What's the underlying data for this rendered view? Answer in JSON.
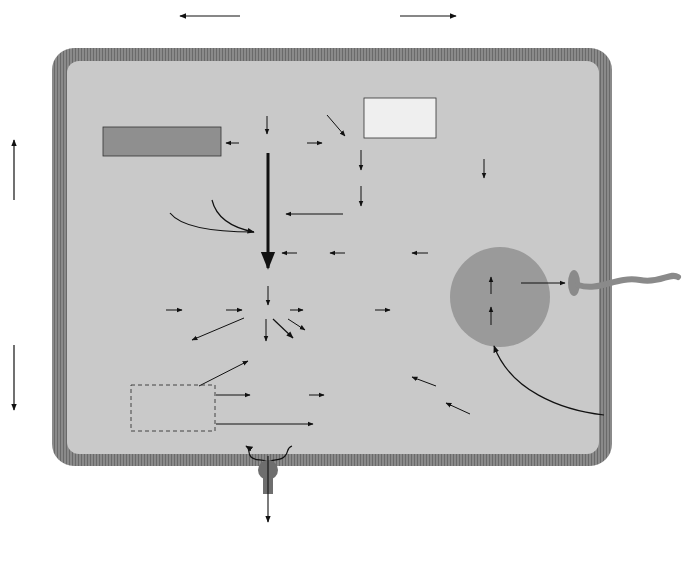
{
  "colors": {
    "cytoplasm": "#c9c9c9",
    "membrane": "#8a8a8a",
    "membrane_dark": "#6e6e6e",
    "abc_transporter": "#8e8e8e",
    "light_transporter": "#d6d6d6",
    "pathway_box_dark": "#8f8f8f",
    "pathway_box_light": "#efefef",
    "chemotaxis_circle": "#9a9a9a",
    "arrow": "#111111"
  },
  "headers": {
    "peptide_abc": "Peptide ABC transport systems",
    "sugar_abc": "Sugar ABC transport systems"
  },
  "pathways": {
    "pentose_phosphate": [
      "PENTOSE PHOSPHATE",
      "PATHWAY"
    ],
    "entner_doudoroff": [
      "ENTNER",
      "DOUDOROFF",
      "PATHWAY"
    ],
    "glycolysis": "Glycolysis"
  },
  "metabolites": {
    "glucose": "Glucose",
    "gluconate": "Gluconate",
    "glucose_6_p": "Glucose-6-P",
    "phosphogluconate": "6 Phosphogluconate",
    "kdpg": "KDPG",
    "gly_3_p_pyruvate": [
      "Gly-3-P",
      "+",
      "Pyruvate"
    ],
    "fructose_6_p": "Fructose-6-P",
    "gly_3_p": "Gly-3-P",
    "dhap": "DHAP",
    "glycerol_3_p": "Glycerol-3-P",
    "glycerol": "Glycerol",
    "pep": "PEP",
    "aspartate_in": "Aspartate",
    "malate": "Malate",
    "pyruvate": "Pyruvate",
    "oxaloacetate": "Oxaloacetate",
    "aspartate_out": "Aspartate",
    "valine": "Valine",
    "lactate": "Lactate",
    "h2_co2": "H₂ and CO₂",
    "acetyl_coa": "Acetyl-CoA",
    "or": "OR",
    "dashed_box": [
      "α-ketoglutarate",
      "Aldehydes",
      "Ketoisovalerate"
    ],
    "glutamate": "Glutamate",
    "proline_glutamine": [
      "Proline",
      "Glutamine"
    ],
    "leucine": "Leucine",
    "gly_acet_thr": [
      "Glycine",
      "Acetamide",
      "Threonine"
    ],
    "nh3_co2_h2": "NH₃ + CO₂ + H₂",
    "histidine": "Histidine",
    "prpp": "PRPP",
    "ribose_5_p": "Ribose-5-P",
    "adp_pi": "ADP + Pᵢ",
    "atp": "ATP"
  },
  "chemotaxis": {
    "flagellar_genes": [
      "33 flagellar &",
      "motor genes"
    ],
    "che_genes": "cheA/B/C/D/R/W/Y",
    "mcps": "7 MCPs"
  },
  "right_labels": [
    {
      "id": "branched",
      "lines": [
        "Branched chain",
        "amino acids"
      ]
    },
    {
      "id": "amino",
      "lines": [
        "Amino acids"
      ]
    },
    {
      "id": "polyamines",
      "lines": [
        "Polyamines"
      ]
    },
    {
      "id": "phosphate",
      "lines": [
        "Phosphate"
      ]
    },
    {
      "id": "flagellum",
      "lines": [
        "Flagellum"
      ]
    },
    {
      "id": "zinc",
      "lines": [
        "Zinc"
      ]
    },
    {
      "id": "iron",
      "lines": [
        "Iron"
      ]
    },
    {
      "id": "chemotactic",
      "lines": [
        "Chemotactic",
        "signals"
      ]
    },
    {
      "id": "cations1",
      "lines": [
        "Cations"
      ]
    },
    {
      "id": "cations2",
      "lines": [
        "Cations"
      ]
    }
  ],
  "bottom_labels": {
    "ribose": "Ribose",
    "maltose": "Maltose",
    "glycerol_3p": "Glycerol 3-P",
    "h_plus": "H⁺",
    "atp_synthase": [
      "ATP",
      "synthase"
    ],
    "glycerol_uptake": [
      "Glycerol",
      "uptake"
    ],
    "uracil": "Uracil",
    "nh4": "NH₄⁺",
    "k": "K⁺",
    "fe": "Fe³⁺",
    "na": "Na⁺"
  }
}
